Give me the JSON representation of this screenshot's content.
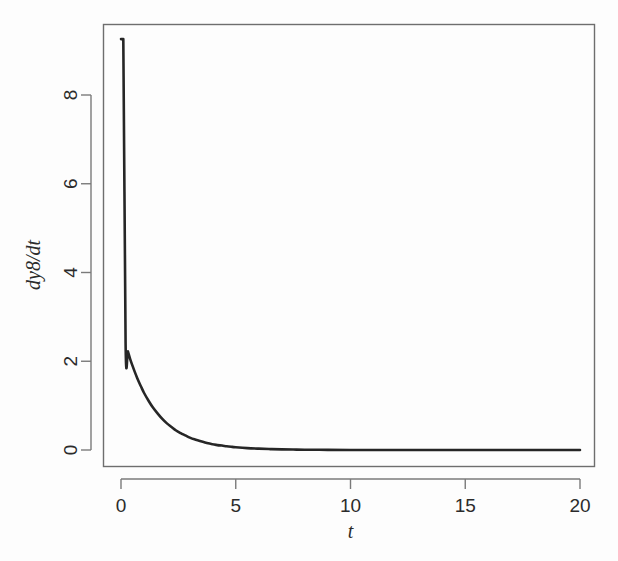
{
  "chart_data": {
    "type": "line",
    "title": "",
    "subtitle": "",
    "xlabel": "t",
    "ylabel": "dy8/dt",
    "xlim": [
      -0.6,
      20.6
    ],
    "ylim": [
      -0.35,
      9.6
    ],
    "xticks": [
      0,
      5,
      10,
      15,
      20
    ],
    "xtick_labels": [
      "0",
      "5",
      "10",
      "15",
      "20"
    ],
    "yticks": [
      0,
      2,
      4,
      6,
      8
    ],
    "ytick_labels": [
      "0",
      "2",
      "4",
      "6",
      "8"
    ],
    "grid": false,
    "legend": null,
    "legend_position": "none",
    "annotations": [],
    "series": [
      {
        "name": "dy8/dt",
        "color": "#262626",
        "line_width": 2.6,
        "x": [
          0.0,
          0.1,
          0.2,
          0.3,
          0.4,
          0.5,
          0.6,
          0.7,
          0.8,
          0.9,
          1.0,
          1.2,
          1.4,
          1.6,
          1.8,
          2.0,
          2.2,
          2.4,
          2.6,
          2.8,
          3.0,
          3.2,
          3.4,
          3.6,
          3.8,
          4.0,
          4.2,
          4.4,
          4.6,
          4.8,
          5.0,
          5.5,
          6.0,
          6.5,
          7.0,
          7.5,
          8.0,
          9.0,
          10.0,
          11.0,
          12.0,
          13.0,
          14.0,
          15.0,
          16.0,
          17.0,
          18.0,
          19.0,
          20.0
        ],
        "y": [
          9.26,
          9.26,
          2.4,
          2.22,
          2.05,
          1.9,
          1.76,
          1.63,
          1.51,
          1.4,
          1.29,
          1.11,
          0.95,
          0.82,
          0.7,
          0.6,
          0.52,
          0.44,
          0.38,
          0.33,
          0.28,
          0.24,
          0.21,
          0.18,
          0.15,
          0.13,
          0.11,
          0.1,
          0.085,
          0.073,
          0.063,
          0.043,
          0.03,
          0.02,
          0.014,
          0.01,
          0.007,
          0.003,
          0.0015,
          0.0008,
          0.0004,
          0.0002,
          0.0001,
          5e-05,
          3e-05,
          2e-05,
          1e-05,
          5e-06,
          0.0
        ]
      }
    ]
  },
  "axes": {
    "x_axis_name": "t",
    "y_axis_name": "dy8/dt"
  },
  "colors": {
    "background": "#fdfdfd",
    "curve": "#262626",
    "frame": "#6e6e6e",
    "text": "#2b2b2b"
  }
}
